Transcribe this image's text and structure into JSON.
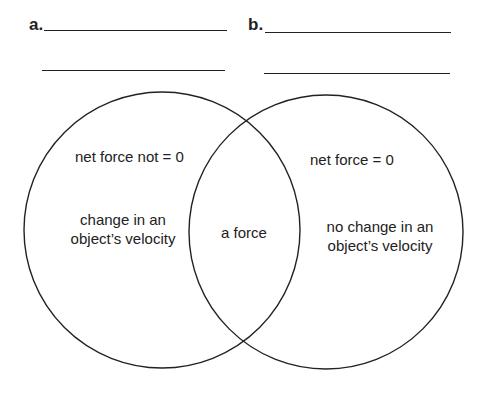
{
  "diagram": {
    "type": "venn",
    "left": {
      "letter": "a.",
      "condition": "net force not = 0",
      "result_line1": "change in an",
      "result_line2": "object’s velocity"
    },
    "right": {
      "letter": "b.",
      "condition": "net force = 0",
      "result_line1": "no change in an",
      "result_line2": "object’s velocity"
    },
    "overlap": "a force"
  }
}
